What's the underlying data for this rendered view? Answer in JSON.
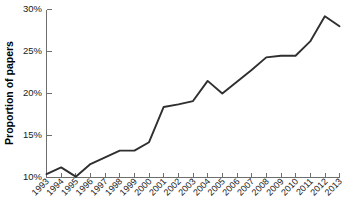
{
  "chart_data": {
    "type": "line",
    "title": "",
    "subtitle": "",
    "xlabel": "",
    "ylabel": "Proportion of papers",
    "categories": [
      "1993",
      "1994",
      "1995",
      "1996",
      "1997",
      "1998",
      "1999",
      "2000",
      "2001",
      "2002",
      "2003",
      "2004",
      "2005",
      "2006",
      "2007",
      "2008",
      "2009",
      "2010",
      "2011",
      "2012",
      "2013"
    ],
    "values": [
      10.4,
      11.2,
      10.1,
      11.6,
      12.4,
      13.2,
      13.2,
      14.2,
      18.4,
      18.7,
      19.1,
      21.5,
      20.0,
      21.4,
      22.8,
      24.3,
      24.5,
      24.5,
      26.2,
      29.2,
      28.0
    ],
    "series": [
      {
        "name": "Proportion of papers",
        "values": [
          10.4,
          11.2,
          10.1,
          11.6,
          12.4,
          13.2,
          13.2,
          14.2,
          18.4,
          18.7,
          19.1,
          21.5,
          20.0,
          21.4,
          22.8,
          24.3,
          24.5,
          24.5,
          26.2,
          29.2,
          28.0
        ]
      }
    ],
    "ylim": [
      10,
      30
    ],
    "yticks": [
      10,
      15,
      20,
      25,
      30
    ],
    "ytick_labels": [
      "10%",
      "15%",
      "20%",
      "25%",
      "30%"
    ],
    "xtick_labels": [
      "1993",
      "1994",
      "1995",
      "1996",
      "1997",
      "1998",
      "1999",
      "2000",
      "2001",
      "2002",
      "2003",
      "2004",
      "2005",
      "2006",
      "2007",
      "2008",
      "2009",
      "2010",
      "2011",
      "2012",
      "2013"
    ],
    "xtick_rotation_degrees": 45,
    "grid": false,
    "legend": false,
    "legend_position": "none",
    "line_color": "#2f2f2f",
    "axis_color": "#6e6e6e",
    "background_color": "#ffffff",
    "annotations": []
  },
  "axes": {
    "y_title": "Proportion of papers"
  }
}
